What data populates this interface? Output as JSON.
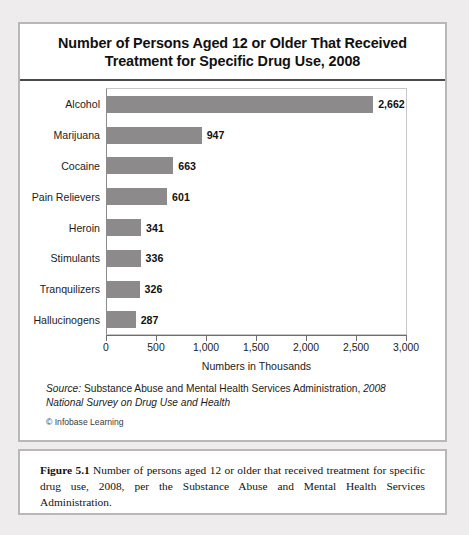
{
  "figure": {
    "title_line1": "Number of Persons Aged 12 or Older That Received",
    "title_line2": "Treatment for Specific Drug Use, 2008",
    "source_label": "Source:",
    "source_agency": " Substance Abuse and Mental Health Services Administration, ",
    "source_survey": "2008 National Survey on Drug Use and Health",
    "copyright": "© Infobase Learning"
  },
  "caption": {
    "figure_number": "Figure 5.1",
    "text": "  Number of persons aged 12 or older that received treatment for specific drug use, 2008, per the Substance Abuse and Mental Health Services Administration."
  },
  "colors": {
    "bar_fill": "#8c8a8a",
    "card_border": "#b9b7b7",
    "title_rule": "#4a4a4a",
    "page_background": "#eeecec"
  },
  "chart_data": {
    "type": "bar",
    "orientation": "horizontal",
    "title": "Number of Persons Aged 12 or Older That Received Treatment for Specific Drug Use, 2008",
    "xlabel": "Numbers in Thousands",
    "ylabel": "",
    "categories": [
      "Alcohol",
      "Marijuana",
      "Cocaine",
      "Pain Relievers",
      "Heroin",
      "Stimulants",
      "Tranquilizers",
      "Hallucinogens"
    ],
    "values": [
      2662,
      947,
      663,
      601,
      341,
      336,
      326,
      287
    ],
    "value_labels": [
      "2,662",
      "947",
      "663",
      "601",
      "341",
      "336",
      "326",
      "287"
    ],
    "xlim": [
      0,
      3000
    ],
    "xticks": [
      0,
      500,
      1000,
      1500,
      2000,
      2500,
      3000
    ],
    "xtick_labels": [
      "0",
      "500",
      "1,000",
      "1,500",
      "2,000",
      "2,500",
      "3,000"
    ],
    "grid": false,
    "legend": false
  }
}
